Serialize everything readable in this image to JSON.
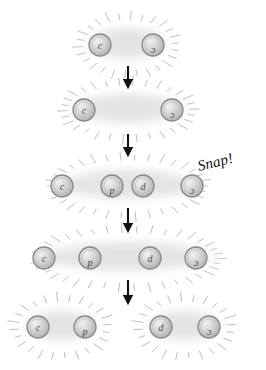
{
  "figure": {
    "background_color": "#ffffff",
    "width": 266,
    "height": 370,
    "annotation": {
      "text": "Snap!",
      "x": 200,
      "y": 158,
      "rotation_deg": -14
    },
    "colors": {
      "blob_fill": "#e8e8e8",
      "blob_edge": "#f6f6f6",
      "circle_fill": "#cfcfcf",
      "circle_edge": "#8a8a8a",
      "tick": "#b5b5b5",
      "arrow": "#111111",
      "label_text": "#4a4a4a"
    }
  },
  "rows": [
    {
      "name": "row-1-compact-pair",
      "y": 45,
      "blobs": [
        {
          "cx": 128,
          "cy": 45,
          "rx": 46,
          "ry": 20
        }
      ],
      "particles": [
        {
          "label": "c",
          "flip": false,
          "cx": 100,
          "cy": 45
        },
        {
          "label": "c",
          "flip": true,
          "cx": 153,
          "cy": 45
        }
      ],
      "rays": {
        "cx": 128,
        "cy": 45,
        "rx": 54,
        "ry": 27,
        "count": 26
      }
    },
    {
      "name": "row-2-stretched-pair",
      "y": 110,
      "blobs": [
        {
          "cx": 128,
          "cy": 110,
          "rx": 64,
          "ry": 19
        }
      ],
      "particles": [
        {
          "label": "c",
          "flip": false,
          "cx": 84,
          "cy": 110
        },
        {
          "label": "c",
          "flip": true,
          "cx": 172,
          "cy": 110
        }
      ],
      "rays": {
        "cx": 128,
        "cy": 110,
        "rx": 74,
        "ry": 26,
        "count": 30
      }
    },
    {
      "name": "row-3-pair-creation",
      "y": 186,
      "blobs": [
        {
          "cx": 128,
          "cy": 186,
          "rx": 78,
          "ry": 19
        }
      ],
      "particles": [
        {
          "label": "c",
          "flip": false,
          "cx": 62,
          "cy": 186
        },
        {
          "label": "d",
          "flip": true,
          "cx": 112,
          "cy": 186
        },
        {
          "label": "d",
          "flip": false,
          "cx": 143,
          "cy": 186
        },
        {
          "label": "c",
          "flip": true,
          "cx": 192,
          "cy": 186
        }
      ],
      "rays": {
        "cx": 128,
        "cy": 186,
        "rx": 88,
        "ry": 27,
        "count": 34
      }
    },
    {
      "name": "row-4-separating",
      "y": 258,
      "blobs": [
        {
          "cx": 128,
          "cy": 258,
          "rx": 96,
          "ry": 19
        }
      ],
      "particles": [
        {
          "label": "c",
          "flip": false,
          "cx": 44,
          "cy": 258
        },
        {
          "label": "d",
          "flip": true,
          "cx": 90,
          "cy": 258
        },
        {
          "label": "d",
          "flip": false,
          "cx": 150,
          "cy": 258
        },
        {
          "label": "c",
          "flip": true,
          "cx": 196,
          "cy": 258
        }
      ],
      "rays": {
        "cx": 128,
        "cy": 258,
        "rx": 106,
        "ry": 27,
        "count": 38
      }
    },
    {
      "name": "row-5-two-mesons",
      "y": 327,
      "blobs": [
        {
          "cx": 61,
          "cy": 327,
          "rx": 42,
          "ry": 19
        },
        {
          "cx": 185,
          "cy": 327,
          "rx": 42,
          "ry": 19
        }
      ],
      "particles": [
        {
          "label": "c",
          "flip": false,
          "cx": 38,
          "cy": 327
        },
        {
          "label": "d",
          "flip": true,
          "cx": 85,
          "cy": 327
        },
        {
          "label": "d",
          "flip": false,
          "cx": 161,
          "cy": 327
        },
        {
          "label": "c",
          "flip": true,
          "cx": 209,
          "cy": 327
        }
      ],
      "rays_groups": [
        {
          "cx": 61,
          "cy": 327,
          "rx": 52,
          "ry": 27,
          "count": 24
        },
        {
          "cx": 185,
          "cy": 327,
          "rx": 52,
          "ry": 27,
          "count": 24
        }
      ]
    }
  ],
  "arrows": [
    {
      "name": "arrow-1-2",
      "x": 128,
      "y1": 66,
      "y2": 84
    },
    {
      "name": "arrow-2-3",
      "x": 128,
      "y1": 134,
      "y2": 152
    },
    {
      "name": "arrow-3-4",
      "x": 128,
      "y1": 208,
      "y2": 228
    },
    {
      "name": "arrow-4-5",
      "x": 128,
      "y1": 280,
      "y2": 300
    }
  ]
}
